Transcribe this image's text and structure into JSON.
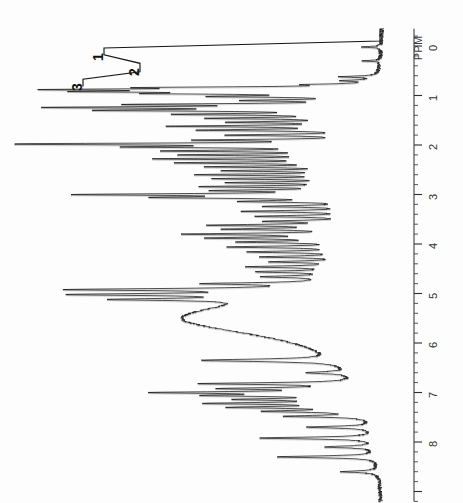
{
  "figure": {
    "kind": "nmr-spectrum-scan",
    "orientation": "rotated-90-ccw",
    "background_color": "#fdfdfd",
    "trace_color": "#111111"
  },
  "axis": {
    "label": "PPM",
    "tick_labels": [
      "0",
      "1",
      "2",
      "3",
      "4",
      "5",
      "6",
      "7",
      "8"
    ],
    "major_tick_values": [
      0,
      1,
      2,
      3,
      4,
      5,
      6,
      7,
      8
    ],
    "minor_tick_step": 0.2,
    "range": [
      -0.35,
      9.2
    ],
    "axis_line_x_px": 414,
    "baseline_x_px": 384,
    "ppm_zero_y_px": 46,
    "px_per_ppm": 49.5
  },
  "integration_labels": [
    {
      "text": "1",
      "ppm": 0.12
    },
    {
      "text": "2",
      "ppm": 0.42
    },
    {
      "text": "3",
      "ppm": 0.72
    }
  ],
  "chart_data": {
    "type": "line",
    "title": "",
    "xlabel": "PPM",
    "ylabel": "",
    "xlim": [
      9.2,
      -0.35
    ],
    "grid": false,
    "legend": null,
    "annotations": [
      "1",
      "2",
      "3",
      "PPM"
    ],
    "tick_labels": [
      "0",
      "1",
      "2",
      "3",
      "4",
      "5",
      "6",
      "7",
      "8"
    ],
    "peaks": [
      {
        "ppm": 0.02,
        "intensity": 0.06,
        "width": 0.012
      },
      {
        "ppm": 0.3,
        "intensity": 0.05,
        "width": 0.012
      },
      {
        "ppm": 0.62,
        "intensity": 0.1,
        "width": 0.015
      },
      {
        "ppm": 0.7,
        "intensity": 0.08,
        "width": 0.015
      },
      {
        "ppm": 0.78,
        "intensity": 0.14,
        "width": 0.015
      },
      {
        "ppm": 0.84,
        "intensity": 0.5,
        "width": 0.018
      },
      {
        "ppm": 0.88,
        "intensity": 0.72,
        "width": 0.018
      },
      {
        "ppm": 0.92,
        "intensity": 0.62,
        "width": 0.018
      },
      {
        "ppm": 0.96,
        "intensity": 0.46,
        "width": 0.018
      },
      {
        "ppm": 1.02,
        "intensity": 0.38,
        "width": 0.018
      },
      {
        "ppm": 1.1,
        "intensity": 0.3,
        "width": 0.018
      },
      {
        "ppm": 1.18,
        "intensity": 0.58,
        "width": 0.018
      },
      {
        "ppm": 1.24,
        "intensity": 0.8,
        "width": 0.02
      },
      {
        "ppm": 1.3,
        "intensity": 0.66,
        "width": 0.02
      },
      {
        "ppm": 1.38,
        "intensity": 0.48,
        "width": 0.02
      },
      {
        "ppm": 1.46,
        "intensity": 0.4,
        "width": 0.02
      },
      {
        "ppm": 1.54,
        "intensity": 0.34,
        "width": 0.02
      },
      {
        "ppm": 1.62,
        "intensity": 0.52,
        "width": 0.02
      },
      {
        "ppm": 1.7,
        "intensity": 0.44,
        "width": 0.02
      },
      {
        "ppm": 1.8,
        "intensity": 0.36,
        "width": 0.02
      },
      {
        "ppm": 1.9,
        "intensity": 0.42,
        "width": 0.018
      },
      {
        "ppm": 1.98,
        "intensity": 1.0,
        "width": 0.02
      },
      {
        "ppm": 2.04,
        "intensity": 0.56,
        "width": 0.02
      },
      {
        "ppm": 2.12,
        "intensity": 0.5,
        "width": 0.02
      },
      {
        "ppm": 2.2,
        "intensity": 0.46,
        "width": 0.02
      },
      {
        "ppm": 2.28,
        "intensity": 0.54,
        "width": 0.02
      },
      {
        "ppm": 2.36,
        "intensity": 0.48,
        "width": 0.02
      },
      {
        "ppm": 2.44,
        "intensity": 0.4,
        "width": 0.02
      },
      {
        "ppm": 2.52,
        "intensity": 0.36,
        "width": 0.02
      },
      {
        "ppm": 2.6,
        "intensity": 0.44,
        "width": 0.02
      },
      {
        "ppm": 2.68,
        "intensity": 0.38,
        "width": 0.02
      },
      {
        "ppm": 2.76,
        "intensity": 0.34,
        "width": 0.02
      },
      {
        "ppm": 2.84,
        "intensity": 0.42,
        "width": 0.02
      },
      {
        "ppm": 2.92,
        "intensity": 0.36,
        "width": 0.02
      },
      {
        "ppm": 3.0,
        "intensity": 0.74,
        "width": 0.022
      },
      {
        "ppm": 3.06,
        "intensity": 0.5,
        "width": 0.022
      },
      {
        "ppm": 3.14,
        "intensity": 0.3,
        "width": 0.022
      },
      {
        "ppm": 3.24,
        "intensity": 0.26,
        "width": 0.022
      },
      {
        "ppm": 3.34,
        "intensity": 0.32,
        "width": 0.022
      },
      {
        "ppm": 3.44,
        "intensity": 0.28,
        "width": 0.022
      },
      {
        "ppm": 3.54,
        "intensity": 0.24,
        "width": 0.022
      },
      {
        "ppm": 3.62,
        "intensity": 0.4,
        "width": 0.022
      },
      {
        "ppm": 3.7,
        "intensity": 0.34,
        "width": 0.022
      },
      {
        "ppm": 3.8,
        "intensity": 0.46,
        "width": 0.022
      },
      {
        "ppm": 3.88,
        "intensity": 0.38,
        "width": 0.022
      },
      {
        "ppm": 3.96,
        "intensity": 0.3,
        "width": 0.022
      },
      {
        "ppm": 4.06,
        "intensity": 0.34,
        "width": 0.022
      },
      {
        "ppm": 4.16,
        "intensity": 0.28,
        "width": 0.022
      },
      {
        "ppm": 4.26,
        "intensity": 0.24,
        "width": 0.022
      },
      {
        "ppm": 4.36,
        "intensity": 0.2,
        "width": 0.022
      },
      {
        "ppm": 4.46,
        "intensity": 0.26,
        "width": 0.022
      },
      {
        "ppm": 4.56,
        "intensity": 0.22,
        "width": 0.022
      },
      {
        "ppm": 4.66,
        "intensity": 0.18,
        "width": 0.022
      },
      {
        "ppm": 4.8,
        "intensity": 0.3,
        "width": 0.022
      },
      {
        "ppm": 4.92,
        "intensity": 0.62,
        "width": 0.025
      },
      {
        "ppm": 5.02,
        "intensity": 0.56,
        "width": 0.025
      },
      {
        "ppm": 5.12,
        "intensity": 0.4,
        "width": 0.025
      },
      {
        "ppm": 5.5,
        "intensity": 0.55,
        "width": 0.45,
        "note": "broad-solvent-hump"
      },
      {
        "ppm": 6.35,
        "intensity": 0.38,
        "width": 0.03
      },
      {
        "ppm": 6.6,
        "intensity": 0.12,
        "width": 0.025
      },
      {
        "ppm": 6.82,
        "intensity": 0.42,
        "width": 0.022
      },
      {
        "ppm": 6.92,
        "intensity": 0.34,
        "width": 0.022
      },
      {
        "ppm": 7.0,
        "intensity": 0.52,
        "width": 0.022
      },
      {
        "ppm": 7.06,
        "intensity": 0.36,
        "width": 0.022
      },
      {
        "ppm": 7.14,
        "intensity": 0.3,
        "width": 0.022
      },
      {
        "ppm": 7.22,
        "intensity": 0.4,
        "width": 0.022
      },
      {
        "ppm": 7.3,
        "intensity": 0.34,
        "width": 0.022
      },
      {
        "ppm": 7.38,
        "intensity": 0.26,
        "width": 0.022
      },
      {
        "ppm": 7.48,
        "intensity": 0.22,
        "width": 0.022
      },
      {
        "ppm": 7.7,
        "intensity": 0.18,
        "width": 0.022
      },
      {
        "ppm": 7.92,
        "intensity": 0.32,
        "width": 0.022
      },
      {
        "ppm": 8.1,
        "intensity": 0.14,
        "width": 0.022
      },
      {
        "ppm": 8.3,
        "intensity": 0.28,
        "width": 0.022
      },
      {
        "ppm": 8.6,
        "intensity": 0.1,
        "width": 0.022
      }
    ],
    "integration_steps": [
      {
        "label": "1",
        "ppm_start": -0.1,
        "ppm_end": 0.18,
        "height": 0.92
      },
      {
        "label": "2",
        "ppm_start": 0.18,
        "ppm_end": 0.52,
        "height": 0.8
      },
      {
        "label": "3",
        "ppm_start": 0.52,
        "ppm_end": 0.82,
        "height": 0.99
      }
    ]
  }
}
